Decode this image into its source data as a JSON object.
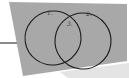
{
  "diagram": {
    "type": "venn",
    "sets": 2,
    "regions": [
      {
        "id": "left-only",
        "label": "1."
      },
      {
        "id": "right-only",
        "label": "2."
      },
      {
        "id": "intersection",
        "label": "3."
      }
    ]
  },
  "colors": {
    "background": "#ffffff",
    "paper": "#a9a9a9",
    "ink": "#1a1a1a",
    "left_rule": "#6f6f6f",
    "bottom_strip": "#d8d8d8"
  }
}
